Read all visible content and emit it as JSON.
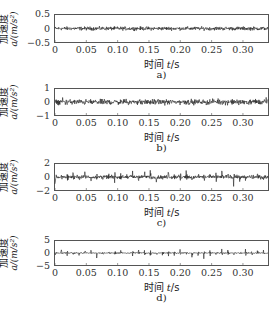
{
  "chart_data": [
    {
      "type": "line",
      "panel": "a)",
      "caption": "a)",
      "xlabel": "时间 t/s",
      "ylabel": "加速度 a/(m/s²)",
      "xlim": [
        0,
        0.34
      ],
      "ylim": [
        -0.5,
        0.5
      ],
      "xticks": [
        "0",
        "0.05",
        "0.10",
        "0.15",
        "0.20",
        "0.25",
        "0.30"
      ],
      "yticks": [
        "0.5",
        "0",
        "-0.5"
      ],
      "description": "Low-amplitude random vibration signal around 0, amplitude roughly ±0.1 m/s²",
      "amplitude": 0.1,
      "impulse_period": null,
      "color": "#222222"
    },
    {
      "type": "line",
      "panel": "b)",
      "caption": "b)",
      "xlabel": "时间 t/s",
      "ylabel": "加速度 a/(m/s²)",
      "xlim": [
        0,
        0.34
      ],
      "ylim": [
        -1,
        1
      ],
      "xticks": [
        "0",
        "0.05",
        "0.10",
        "0.15",
        "0.20",
        "0.25",
        "0.30"
      ],
      "yticks": [
        "1",
        "0",
        "-1"
      ],
      "description": "Vibration signal with amplitude roughly ±0.3 m/s², occasional peaks to ~0.5",
      "amplitude": 0.3,
      "impulse_period": null,
      "color": "#222222"
    },
    {
      "type": "line",
      "panel": "c)",
      "caption": "c)",
      "xlabel": "时间 t/s",
      "ylabel": "加速度 a/(m/s²)",
      "xlim": [
        0,
        0.34
      ],
      "ylim": [
        -2,
        2
      ],
      "xticks": [
        "0",
        "0.05",
        "0.10",
        "0.15",
        "0.20",
        "0.25",
        "0.30"
      ],
      "yticks": [
        "2",
        "0",
        "-2"
      ],
      "description": "Vibration signal with periodic impulses, peaks ~±1.5 m/s², baseline ±0.4",
      "amplitude": 0.4,
      "impulse_amplitude": 1.5,
      "impulse_period": 0.0095,
      "color": "#222222"
    },
    {
      "type": "line",
      "panel": "d)",
      "caption": "d)",
      "xlabel": "时间 t/s",
      "ylabel": "加速度 a/(m/s²)",
      "xlim": [
        0,
        0.34
      ],
      "ylim": [
        -5,
        5
      ],
      "xticks": [
        "0",
        "0.05",
        "0.10",
        "0.15",
        "0.20",
        "0.25",
        "0.30"
      ],
      "yticks": [
        "5",
        "0",
        "-5"
      ],
      "description": "Strong periodic impact signal, impulses ~±2.5 m/s² evenly spaced, baseline ±0.3",
      "amplitude": 0.3,
      "impulse_amplitude": 2.5,
      "impulse_period": 0.0095,
      "color": "#222222"
    }
  ],
  "labels": {
    "ylabel_line1": "加速度",
    "ylabel_line2": "a/(m/s²)",
    "xlabel_prefix": "时间 ",
    "xlabel_var": "t",
    "xlabel_unit": "/s"
  }
}
